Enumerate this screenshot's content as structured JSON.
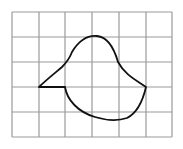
{
  "diagram": {
    "type": "grid-figure",
    "grid": {
      "columns": 6,
      "rows": 5,
      "x_lines": [
        12,
        39,
        65,
        92,
        119,
        146,
        172
      ],
      "y_lines": [
        12,
        37,
        62,
        87,
        112,
        137
      ],
      "line_color": "#9a9a9a"
    },
    "shape": {
      "description": "closed curved figure drawn on square grid",
      "stroke_color": "#111111",
      "path": "M39,87 L65,87 C67,100 78,112 95,117 C105,120 118,121 127,118 C137,113 143,100 146,87 C136,80 125,75 118,62 C114,48 108,37 97,36 C86,35 78,42 72,52 C69,60 66,63 62,67 C55,73 46,80 39,87 Z"
    }
  }
}
